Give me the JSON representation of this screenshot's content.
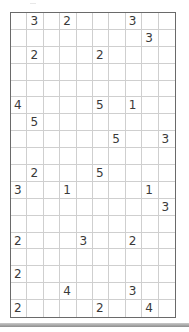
{
  "puzzle": {
    "rows": 18,
    "cols": 10,
    "clues": [
      [
        null,
        "3",
        null,
        "2",
        null,
        null,
        null,
        "3",
        null,
        null
      ],
      [
        null,
        null,
        null,
        null,
        null,
        null,
        null,
        null,
        "3",
        null
      ],
      [
        null,
        "2",
        null,
        null,
        null,
        "2",
        null,
        null,
        null,
        null
      ],
      [
        null,
        null,
        null,
        null,
        null,
        null,
        null,
        null,
        null,
        null
      ],
      [
        null,
        null,
        null,
        null,
        null,
        null,
        null,
        null,
        null,
        null
      ],
      [
        "4",
        null,
        null,
        null,
        null,
        "5",
        null,
        "1",
        null,
        null
      ],
      [
        null,
        "5",
        null,
        null,
        null,
        null,
        null,
        null,
        null,
        null
      ],
      [
        null,
        null,
        null,
        null,
        null,
        null,
        "5",
        null,
        null,
        "3"
      ],
      [
        null,
        null,
        null,
        null,
        null,
        null,
        null,
        null,
        null,
        null
      ],
      [
        null,
        "2",
        null,
        null,
        null,
        "5",
        null,
        null,
        null,
        null
      ],
      [
        "3",
        null,
        null,
        "1",
        null,
        null,
        null,
        null,
        "1",
        null
      ],
      [
        null,
        null,
        null,
        null,
        null,
        null,
        null,
        null,
        null,
        "3"
      ],
      [
        null,
        null,
        null,
        null,
        null,
        null,
        null,
        null,
        null,
        null
      ],
      [
        "2",
        null,
        null,
        null,
        "3",
        null,
        null,
        "2",
        null,
        null
      ],
      [
        null,
        null,
        null,
        null,
        null,
        null,
        null,
        null,
        null,
        null
      ],
      [
        "2",
        null,
        null,
        null,
        null,
        null,
        null,
        null,
        null,
        null
      ],
      [
        null,
        null,
        null,
        "4",
        null,
        null,
        null,
        "3",
        null,
        null
      ],
      [
        "2",
        null,
        null,
        null,
        null,
        "2",
        null,
        null,
        "4",
        null
      ]
    ]
  },
  "colors": {
    "grid_border": "#6a6a6a",
    "grid_line": "#cfcfcf",
    "clue_text": "#3a3a3a"
  }
}
